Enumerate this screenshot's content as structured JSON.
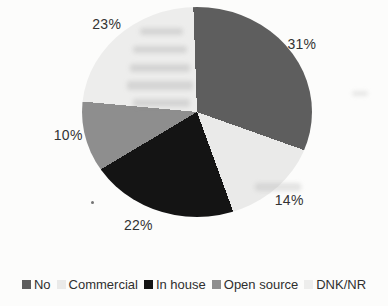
{
  "chart_data": {
    "type": "pie",
    "title": "",
    "categories": [
      "No",
      "Commercial",
      "In house",
      "Open source",
      "DNK/NR"
    ],
    "values": [
      31,
      14,
      22,
      10,
      23
    ],
    "slices": [
      {
        "label": "No",
        "value": 31,
        "display": "31%",
        "color": "#5e5e5e",
        "label_dx": 0,
        "label_dy": 4
      },
      {
        "label": "Commercial",
        "value": 14,
        "display": "14%",
        "color": "#eaeae9",
        "label_dx": 0,
        "label_dy": 2
      },
      {
        "label": "In house",
        "value": 22,
        "display": "22%",
        "color": "#141414",
        "label_dx": -15,
        "label_dy": -2
      },
      {
        "label": "Open source",
        "value": 10,
        "display": "10%",
        "color": "#8e8e8e",
        "label_dx": -2,
        "label_dy": -4
      },
      {
        "label": "DNK/NR",
        "value": 23,
        "display": "23%",
        "color": "#ededec",
        "label_dx": -1,
        "label_dy": 1
      }
    ],
    "start_angle_deg": -2,
    "direction": "clockwise",
    "legend_position": "bottom",
    "label_format": "percent",
    "text_color": "#333333",
    "background_color": "#fcfcfb"
  }
}
